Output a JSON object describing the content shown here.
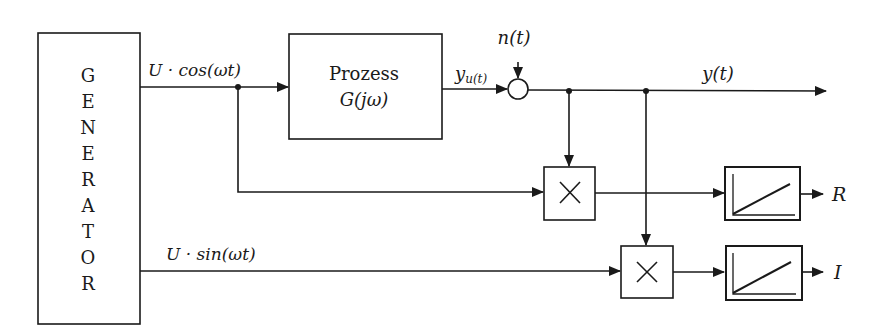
{
  "diagram": {
    "type": "block-diagram",
    "generator": {
      "letters": [
        "G",
        "E",
        "N",
        "E",
        "R",
        "A",
        "T",
        "O",
        "R"
      ]
    },
    "process": {
      "line1": "Prozess",
      "line2": "G(jω)"
    },
    "signals": {
      "cos": "U · cos(ωt)",
      "sin": "U · sin(ωt)",
      "yu_main": "y",
      "yu_sub": "u(t)",
      "noise": "n(t)",
      "output": "y(t)",
      "R": "R",
      "I": "I"
    },
    "multiplier_symbol": "×",
    "colors": {
      "stroke": "#1a1a1a",
      "background": "#ffffff"
    }
  }
}
